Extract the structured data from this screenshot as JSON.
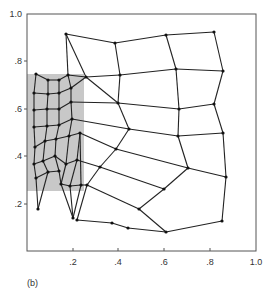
{
  "figure": {
    "panel_label": "(b)",
    "frame": {
      "left": 27,
      "top": 14,
      "right": 256,
      "bottom": 251,
      "color": "#555555"
    },
    "shaded_region": {
      "x": 27,
      "y": 74,
      "width": 57,
      "height": 117,
      "color": "#c8c8c8"
    },
    "x_axis": {
      "ticks": [
        {
          "label": ".2",
          "x": 73
        },
        {
          "label": ".4",
          "x": 118
        },
        {
          "label": ".6",
          "x": 164
        },
        {
          "label": ".8",
          "x": 210
        },
        {
          "label": "1.0",
          "x": 256
        }
      ]
    },
    "y_axis": {
      "ticks": [
        {
          "label": "1.0",
          "y": 14
        },
        {
          "label": ".8",
          "y": 61
        },
        {
          "label": ".6",
          "y": 109
        },
        {
          "label": ".4",
          "y": 156
        },
        {
          "label": ".2",
          "y": 204
        }
      ]
    },
    "mesh": {
      "line_color": "#222222",
      "node_color": "#111111",
      "nodes": [
        [
          36,
          74
        ],
        [
          48,
          80
        ],
        [
          59,
          80
        ],
        [
          68,
          75
        ],
        [
          34,
          93
        ],
        [
          48,
          94
        ],
        [
          59,
          93
        ],
        [
          71,
          88
        ],
        [
          34,
          110
        ],
        [
          47,
          109
        ],
        [
          59,
          109
        ],
        [
          71,
          102
        ],
        [
          34,
          127
        ],
        [
          47,
          126
        ],
        [
          59,
          125
        ],
        [
          72,
          119
        ],
        [
          35,
          147
        ],
        [
          45,
          141
        ],
        [
          56,
          139
        ],
        [
          69,
          136
        ],
        [
          80,
          133
        ],
        [
          34,
          164
        ],
        [
          43,
          161
        ],
        [
          55,
          156
        ],
        [
          66,
          164
        ],
        [
          77,
          160
        ],
        [
          36,
          178
        ],
        [
          48,
          172
        ],
        [
          59,
          171
        ],
        [
          61,
          184
        ],
        [
          70,
          186
        ],
        [
          81,
          185
        ],
        [
          38,
          209
        ],
        [
          73,
          218
        ],
        [
          66,
          34
        ],
        [
          115,
          43
        ],
        [
          166,
          35
        ],
        [
          214,
          32
        ],
        [
          86,
          77
        ],
        [
          120,
          75
        ],
        [
          176,
          69
        ],
        [
          223,
          71
        ],
        [
          118,
          103
        ],
        [
          179,
          109
        ],
        [
          214,
          104
        ],
        [
          129,
          129
        ],
        [
          178,
          136
        ],
        [
          223,
          133
        ],
        [
          116,
          149
        ],
        [
          188,
          168
        ],
        [
          226,
          177
        ],
        [
          100,
          167
        ],
        [
          164,
          189
        ],
        [
          87,
          185
        ],
        [
          139,
          209
        ],
        [
          77,
          220
        ],
        [
          112,
          223
        ],
        [
          128,
          228
        ],
        [
          166,
          232
        ],
        [
          222,
          221
        ]
      ],
      "edges": [
        [
          0,
          1
        ],
        [
          1,
          2
        ],
        [
          2,
          3
        ],
        [
          4,
          5
        ],
        [
          5,
          6
        ],
        [
          6,
          7
        ],
        [
          8,
          9
        ],
        [
          9,
          10
        ],
        [
          10,
          11
        ],
        [
          12,
          13
        ],
        [
          13,
          14
        ],
        [
          14,
          15
        ],
        [
          16,
          17
        ],
        [
          17,
          18
        ],
        [
          18,
          19
        ],
        [
          19,
          20
        ],
        [
          21,
          22
        ],
        [
          22,
          23
        ],
        [
          23,
          24
        ],
        [
          24,
          25
        ],
        [
          26,
          27
        ],
        [
          27,
          28
        ],
        [
          28,
          29
        ],
        [
          29,
          30
        ],
        [
          30,
          31
        ],
        [
          0,
          4
        ],
        [
          4,
          8
        ],
        [
          8,
          12
        ],
        [
          12,
          16
        ],
        [
          16,
          21
        ],
        [
          21,
          26
        ],
        [
          26,
          32
        ],
        [
          1,
          5
        ],
        [
          5,
          9
        ],
        [
          9,
          13
        ],
        [
          13,
          17
        ],
        [
          17,
          22
        ],
        [
          22,
          27
        ],
        [
          27,
          32
        ],
        [
          2,
          6
        ],
        [
          6,
          10
        ],
        [
          10,
          14
        ],
        [
          14,
          18
        ],
        [
          18,
          23
        ],
        [
          23,
          28
        ],
        [
          3,
          7
        ],
        [
          7,
          11
        ],
        [
          11,
          15
        ],
        [
          15,
          19
        ],
        [
          19,
          24
        ],
        [
          24,
          29
        ],
        [
          29,
          33
        ],
        [
          20,
          25
        ],
        [
          25,
          30
        ],
        [
          30,
          33
        ],
        [
          31,
          33
        ],
        [
          3,
          34
        ],
        [
          3,
          38
        ],
        [
          34,
          38
        ],
        [
          7,
          38
        ],
        [
          11,
          42
        ],
        [
          15,
          45
        ],
        [
          20,
          48
        ],
        [
          25,
          51
        ],
        [
          31,
          53
        ],
        [
          34,
          35
        ],
        [
          35,
          36
        ],
        [
          36,
          37
        ],
        [
          38,
          39
        ],
        [
          39,
          40
        ],
        [
          40,
          41
        ],
        [
          42,
          43
        ],
        [
          43,
          44
        ],
        [
          45,
          46
        ],
        [
          46,
          47
        ],
        [
          48,
          49
        ],
        [
          49,
          50
        ],
        [
          51,
          52
        ],
        [
          53,
          54
        ],
        [
          35,
          39
        ],
        [
          39,
          42
        ],
        [
          42,
          45
        ],
        [
          45,
          48
        ],
        [
          48,
          51
        ],
        [
          51,
          53
        ],
        [
          53,
          55
        ],
        [
          36,
          40
        ],
        [
          40,
          43
        ],
        [
          43,
          46
        ],
        [
          46,
          49
        ],
        [
          49,
          52
        ],
        [
          52,
          54
        ],
        [
          54,
          58
        ],
        [
          37,
          41
        ],
        [
          41,
          44
        ],
        [
          44,
          47
        ],
        [
          47,
          50
        ],
        [
          50,
          59
        ],
        [
          55,
          56
        ],
        [
          56,
          57
        ],
        [
          57,
          58
        ],
        [
          58,
          59
        ],
        [
          38,
          42
        ],
        [
          20,
          31
        ]
      ]
    }
  }
}
